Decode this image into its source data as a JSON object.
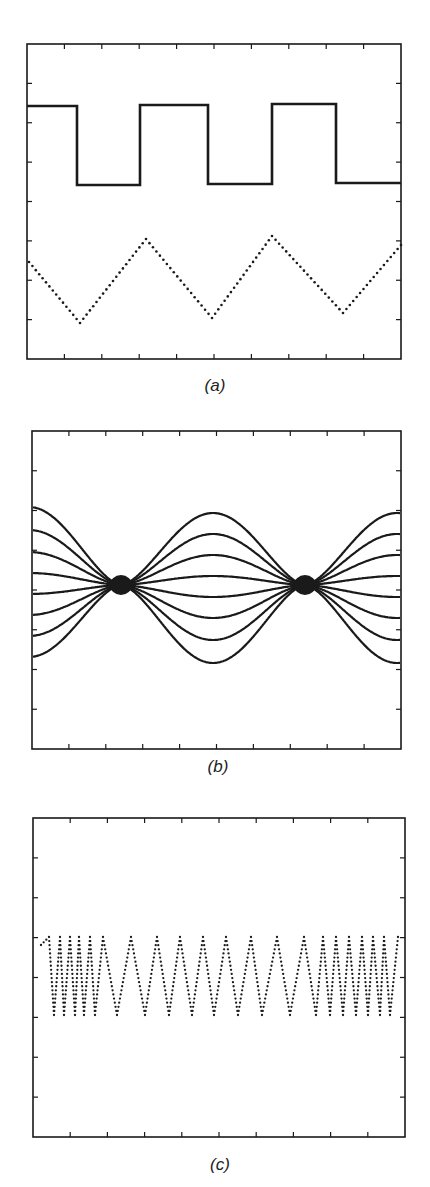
{
  "figure": {
    "background": "#ffffff",
    "ink": "#1a1a1a"
  },
  "chart_data": [
    {
      "panel": "a",
      "label": "(a)",
      "type": "line",
      "title": "",
      "xlabel": "",
      "ylabel": "",
      "frame": {
        "x0": 27,
        "y0": 44,
        "x1": 401,
        "y1": 359
      },
      "ticks": {
        "x_count": 10,
        "y_count": 8
      },
      "grid": false,
      "series": [
        {
          "name": "square wave",
          "style": "solid",
          "points": [
            [
              27,
              106
            ],
            [
              77,
              106
            ],
            [
              77,
              185
            ],
            [
              140,
              185
            ],
            [
              140,
              105
            ],
            [
              208,
              105
            ],
            [
              208,
              184
            ],
            [
              272,
              184
            ],
            [
              272,
              104
            ],
            [
              336,
              104
            ],
            [
              336,
              183
            ],
            [
              401,
              183
            ]
          ]
        },
        {
          "name": "triangle wave",
          "style": "dotted",
          "points": [
            [
              29,
              262
            ],
            [
              80,
              323
            ],
            [
              146,
              239
            ],
            [
              212,
              318
            ],
            [
              272,
              236
            ],
            [
              343,
              313
            ],
            [
              401,
              245
            ]
          ]
        }
      ]
    },
    {
      "panel": "b",
      "label": "(b)",
      "type": "line",
      "title": "",
      "xlabel": "",
      "ylabel": "",
      "frame": {
        "x0": 32,
        "y0": 431,
        "x1": 401,
        "y1": 749
      },
      "ticks": {
        "x_count": 10,
        "y_count": 8
      },
      "grid": false,
      "nodes_x": [
        121,
        305
      ],
      "center_y": 585,
      "period_px": 368,
      "series": [
        {
          "name": "curve 1",
          "amplitude": -72
        },
        {
          "name": "curve 2",
          "amplitude": -51
        },
        {
          "name": "curve 3",
          "amplitude": -30
        },
        {
          "name": "curve 4",
          "amplitude": -9
        },
        {
          "name": "curve 5",
          "amplitude": 12
        },
        {
          "name": "curve 6",
          "amplitude": 33
        },
        {
          "name": "curve 7",
          "amplitude": 55
        },
        {
          "name": "curve 8",
          "amplitude": 78
        }
      ]
    },
    {
      "panel": "c",
      "label": "(c)",
      "type": "line",
      "title": "",
      "xlabel": "",
      "ylabel": "",
      "frame": {
        "x0": 33,
        "y0": 818,
        "x1": 405,
        "y1": 1137
      },
      "ticks": {
        "x_count": 10,
        "y_count": 8
      },
      "grid": false,
      "style": "dotted",
      "y_high": 937,
      "y_low": 1015,
      "vertices_x": [
        41,
        49,
        54,
        60,
        64,
        70,
        75,
        79,
        84,
        90,
        95,
        103,
        117,
        131,
        145,
        157,
        169,
        180,
        192,
        203,
        214,
        226,
        238,
        251,
        262,
        277,
        290,
        304,
        316,
        323,
        330,
        336,
        343,
        349,
        356,
        362,
        368,
        373,
        380,
        384,
        390,
        398
      ],
      "series_description": "aliased sampled sawtooth/triangle oscillation between two levels"
    }
  ]
}
